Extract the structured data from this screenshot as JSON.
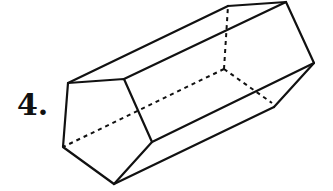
{
  "problem": {
    "number_label": "4."
  },
  "figure": {
    "shape": "pentagonal-prism",
    "stroke_color": "#111111",
    "front_face": [
      [
        68,
        83
      ],
      [
        124,
        79
      ],
      [
        152,
        142
      ],
      [
        114,
        184
      ],
      [
        63,
        147
      ]
    ],
    "back_visible": [
      [
        228,
        6
      ],
      [
        286,
        2
      ],
      [
        314,
        63
      ],
      [
        274,
        107
      ]
    ],
    "back_hidden_vertex": [
      224,
      69
    ]
  }
}
